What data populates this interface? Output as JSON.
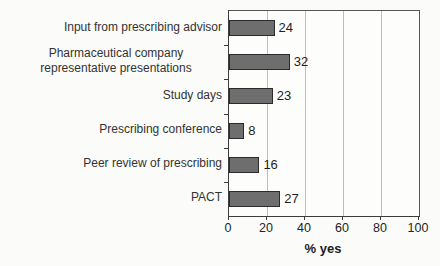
{
  "chart_data": {
    "type": "bar",
    "orientation": "horizontal",
    "categories": [
      "Input from prescribing advisor",
      "Pharmaceutical company representative presentations",
      "Study days",
      "Prescribing conference",
      "Peer review of prescribing",
      "PACT"
    ],
    "values": [
      24,
      32,
      23,
      8,
      16,
      27
    ],
    "value_labels": [
      "24",
      "32",
      "23",
      "8",
      "16",
      "27"
    ],
    "xlabel": "% yes",
    "xlim": [
      0,
      100
    ],
    "xticks": [
      "0",
      "20",
      "40",
      "60",
      "80",
      "100"
    ],
    "grid": "vertical",
    "legend": "none",
    "colors": {
      "bar_fill": "#6e6e6e",
      "bar_border": "#2b2b2b",
      "gridline": "#bdbdbd",
      "axis": "#3c3c3c",
      "plot_background": "#fdfdfc",
      "page_background": "#fbfbf9",
      "text": "#333333"
    }
  }
}
